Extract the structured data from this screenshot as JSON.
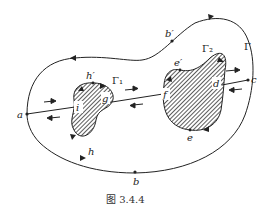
{
  "figure": {
    "caption": "图 3.4.4",
    "colors": {
      "stroke": "#222222",
      "hatch": "#333333",
      "background": "#ffffff"
    },
    "outer_curve": {
      "label": "Γ",
      "points": {
        "a": "a",
        "b": "b",
        "b_prime": "b′",
        "c": "c",
        "h": "h"
      }
    },
    "hole_1": {
      "label": "Γ₁",
      "points": {
        "i": "i",
        "g": "g",
        "h_prime": "h′"
      }
    },
    "hole_2": {
      "label": "Γ₂",
      "points": {
        "f": "f",
        "d": "d",
        "e": "e",
        "e_prime": "e′"
      }
    },
    "cuts": [
      {
        "from": "a",
        "to": "i"
      },
      {
        "from": "g",
        "to": "f"
      },
      {
        "from": "d",
        "to": "c"
      }
    ]
  }
}
